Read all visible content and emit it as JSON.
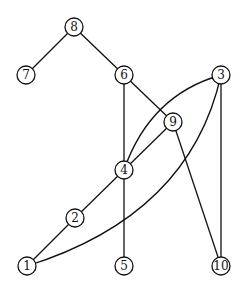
{
  "graph": {
    "type": "undirected",
    "node_radius": 9,
    "colors": {
      "stroke": "#111111",
      "fill": "#ffffff",
      "background": "#ffffff"
    },
    "nodes": [
      {
        "id": "1",
        "label": "1",
        "x": 27,
        "y": 266
      },
      {
        "id": "2",
        "label": "2",
        "x": 75,
        "y": 218
      },
      {
        "id": "3",
        "label": "3",
        "x": 221,
        "y": 75
      },
      {
        "id": "4",
        "label": "4",
        "x": 124,
        "y": 170
      },
      {
        "id": "5",
        "label": "5",
        "x": 124,
        "y": 266
      },
      {
        "id": "6",
        "label": "6",
        "x": 124,
        "y": 75
      },
      {
        "id": "7",
        "label": "7",
        "x": 26,
        "y": 75
      },
      {
        "id": "8",
        "label": "8",
        "x": 74,
        "y": 27
      },
      {
        "id": "9",
        "label": "9",
        "x": 173,
        "y": 122
      },
      {
        "id": "10",
        "label": "10",
        "x": 221,
        "y": 266
      }
    ],
    "edges": [
      {
        "from": "8",
        "to": "7",
        "shape": "line"
      },
      {
        "from": "8",
        "to": "6",
        "shape": "line"
      },
      {
        "from": "6",
        "to": "4",
        "shape": "line"
      },
      {
        "from": "6",
        "to": "9",
        "shape": "line"
      },
      {
        "from": "9",
        "to": "4",
        "shape": "line"
      },
      {
        "from": "9",
        "to": "10",
        "shape": "line"
      },
      {
        "from": "3",
        "to": "10",
        "shape": "line"
      },
      {
        "from": "3",
        "to": "4",
        "shape": "curve",
        "cx": 150,
        "cy": 95
      },
      {
        "from": "3",
        "to": "1",
        "shape": "curve",
        "cx": 190,
        "cy": 215
      },
      {
        "from": "4",
        "to": "2",
        "shape": "line"
      },
      {
        "from": "2",
        "to": "1",
        "shape": "line"
      },
      {
        "from": "4",
        "to": "5",
        "shape": "line"
      }
    ]
  }
}
